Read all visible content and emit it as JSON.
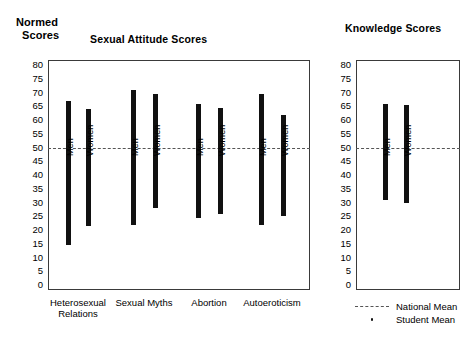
{
  "axis_title": {
    "line1": "Normed",
    "line2": "Scores"
  },
  "legend": {
    "national": {
      "label": "National Mean",
      "key": "dashed-line"
    },
    "student": {
      "label": "Student Mean",
      "key": "dot"
    }
  },
  "chart_data": [
    {
      "type": "bar",
      "id": "sexual-attitude",
      "title": "Sexual Attitude Scores",
      "xlabel": "",
      "ylabel": "Normed Scores",
      "ylim": [
        0,
        80
      ],
      "yticks": [
        80,
        75,
        70,
        65,
        60,
        55,
        50,
        45,
        40,
        35,
        30,
        25,
        20,
        15,
        10,
        5,
        0
      ],
      "grid": false,
      "legend_position": "bottom-right",
      "national_mean": 50,
      "categories": [
        "Heterosexual Relations",
        "Sexual Myths",
        "Abortion",
        "Autoeroticism"
      ],
      "bars": [
        {
          "category": "Heterosexual Relations",
          "group": "Men",
          "low": 14.5,
          "high": 67.0,
          "student_mean": 51.0
        },
        {
          "category": "Heterosexual Relations",
          "group": "Women",
          "low": 21.5,
          "high": 64.0,
          "student_mean": 50.0
        },
        {
          "category": "Sexual Myths",
          "group": "Men",
          "low": 22.0,
          "high": 71.0,
          "student_mean": 51.0
        },
        {
          "category": "Sexual Myths",
          "group": "Women",
          "low": 28.0,
          "high": 69.5,
          "student_mean": 56.0
        },
        {
          "category": "Abortion",
          "group": "Men",
          "low": 24.5,
          "high": 66.0,
          "student_mean": 50.0
        },
        {
          "category": "Abortion",
          "group": "Women",
          "low": 26.0,
          "high": 64.5,
          "student_mean": 48.5
        },
        {
          "category": "Autoeroticism",
          "group": "Men",
          "low": 22.0,
          "high": 69.5,
          "student_mean": 50.5
        },
        {
          "category": "Autoeroticism",
          "group": "Women",
          "low": 25.0,
          "high": 62.0,
          "student_mean": 50.0
        }
      ]
    },
    {
      "type": "bar",
      "id": "knowledge",
      "title": "Knowledge Scores",
      "xlabel": "",
      "ylabel": "Normed Scores",
      "ylim": [
        0,
        80
      ],
      "yticks": [
        80,
        75,
        70,
        65,
        60,
        55,
        50,
        45,
        40,
        35,
        30,
        25,
        20,
        15,
        10,
        5,
        0
      ],
      "grid": false,
      "national_mean": 50,
      "categories": [
        ""
      ],
      "bars": [
        {
          "category": "",
          "group": "Men",
          "low": 31.0,
          "high": 66.0,
          "student_mean": 57.0
        },
        {
          "category": "",
          "group": "Women",
          "low": 30.0,
          "high": 65.5,
          "student_mean": 55.0
        }
      ]
    }
  ]
}
